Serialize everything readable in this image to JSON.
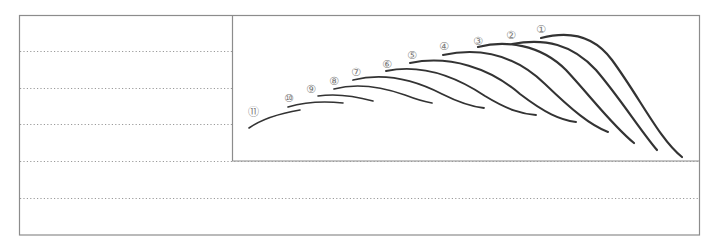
{
  "worksheet": {
    "description": "Brush stroke practice sheet: 11 numbered curved strokes in a box above ruled guideline rows",
    "frame_color": "#8c8c8c",
    "guide_color": "#9a9a9a",
    "ink_color": "#333333",
    "guide_lines_y": [
      51,
      88,
      124,
      161,
      198
    ],
    "strokes": [
      {
        "label": "①",
        "lx": 536,
        "ly": 33,
        "d": "M541,38 C560,33 590,30 612,60 C640,98 660,140 682,157",
        "w": 2.2
      },
      {
        "label": "②",
        "lx": 506,
        "ly": 39,
        "d": "M512,44 C545,38 572,44 596,70 C620,98 640,130 657,150",
        "w": 2.2
      },
      {
        "label": "③",
        "lx": 473,
        "ly": 45,
        "d": "M478,47 C505,40 540,44 566,70 C592,98 612,125 634,143",
        "w": 2.2
      },
      {
        "label": "④",
        "lx": 439,
        "ly": 50,
        "d": "M443,55 C480,47 515,55 545,84 C572,110 590,125 608,132",
        "w": 2.0
      },
      {
        "label": "⑤",
        "lx": 407,
        "ly": 59,
        "d": "M410,63 C450,55 490,68 520,94 C545,113 560,120 576,122",
        "w": 2.0
      },
      {
        "label": "⑥",
        "lx": 382,
        "ly": 68,
        "d": "M386,71 C420,64 455,76 485,96 C508,110 522,114 536,115",
        "w": 1.9
      },
      {
        "label": "⑦",
        "lx": 351,
        "ly": 76,
        "d": "M353,80 C385,72 415,80 442,94 C462,104 474,107 484,108",
        "w": 1.8
      },
      {
        "label": "⑧",
        "lx": 329,
        "ly": 85,
        "d": "M334,89 C360,82 385,88 405,95 C418,100 426,102 432,103",
        "w": 1.7
      },
      {
        "label": "⑨",
        "lx": 306,
        "ly": 93,
        "d": "M318,96 C338,93 355,96 373,101",
        "w": 1.6
      },
      {
        "label": "⑩",
        "lx": 284,
        "ly": 102,
        "d": "M288,107 C305,102 325,101 343,103",
        "w": 1.6
      },
      {
        "label": "⑪",
        "lx": 248,
        "ly": 116,
        "d": "M249,128 C262,119 282,113 300,110",
        "w": 1.6
      }
    ]
  }
}
